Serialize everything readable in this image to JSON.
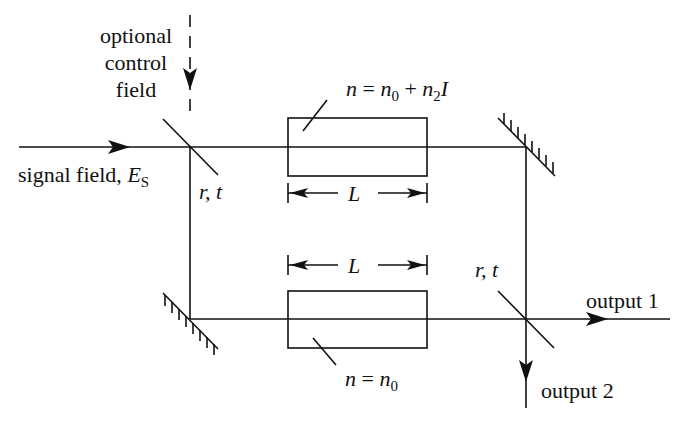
{
  "diagram": {
    "labels": {
      "control_field": [
        "optional",
        "control",
        "field"
      ],
      "signal_field": "signal field, ",
      "signal_symbol": "E",
      "signal_sub": "S",
      "bs1_rt": "r, t",
      "bs2_rt": "r, t",
      "length_top": "L",
      "length_bottom": "L",
      "nonlinear_index": {
        "n": "n",
        "eq": " = ",
        "n0": "n",
        "n0_sub": "0",
        "plus": " + ",
        "n2": "n",
        "n2_sub": "2",
        "I": "I"
      },
      "linear_index": {
        "n": "n",
        "eq": " = ",
        "n0": "n",
        "n0_sub": "0"
      },
      "output1": "output 1",
      "output2": "output 2"
    },
    "colors": {
      "line": "#111111",
      "background": "#ffffff"
    }
  }
}
